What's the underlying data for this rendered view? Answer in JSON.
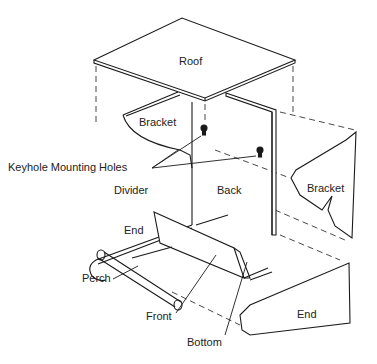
{
  "diagram": {
    "type": "exploded-view assembly drawing",
    "labels": {
      "roof": "Roof",
      "bracket_left": "Bracket",
      "keyhole": "Keyhole Mounting Holes",
      "divider": "Divider",
      "back": "Back",
      "bracket_right": "Bracket",
      "end_left": "End",
      "perch": "Perch",
      "front": "Front",
      "bottom": "Bottom",
      "end_right": "End"
    },
    "colors": {
      "line": "#1a1a1a",
      "background": "#ffffff"
    }
  }
}
